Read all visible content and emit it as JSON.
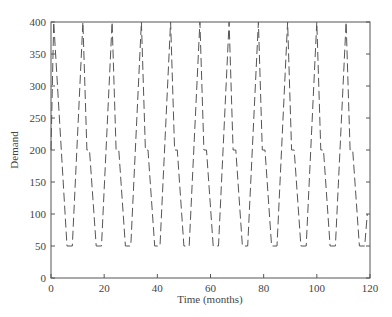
{
  "chart_data": {
    "type": "line",
    "title": "",
    "xlabel": "Time (months)",
    "ylabel": "Demand",
    "xlim": [
      0,
      120
    ],
    "ylim": [
      0,
      400
    ],
    "xticks": [
      0,
      20,
      40,
      60,
      80,
      100,
      120
    ],
    "yticks": [
      0,
      50,
      100,
      150,
      200,
      250,
      300,
      350,
      400
    ],
    "grid": false,
    "legend": null,
    "series": [
      {
        "name": "Demand",
        "style": "dashed",
        "color": "#555555",
        "x": [
          0,
          1,
          6,
          8,
          12,
          13.5,
          14.5,
          17,
          19,
          23,
          24.5,
          25.5,
          28,
          30,
          34,
          35.5,
          36.5,
          39,
          41,
          45,
          46.5,
          47.5,
          50,
          52,
          56,
          57.5,
          58.5,
          61,
          63,
          67,
          68.5,
          69.5,
          72,
          74,
          78,
          79.5,
          80.5,
          83,
          85,
          89,
          90.5,
          91.5,
          94,
          96,
          100,
          101.5,
          102.5,
          105,
          107,
          111,
          112.5,
          113.5,
          116,
          118,
          119
        ],
        "y": [
          200,
          400,
          50,
          50,
          400,
          200,
          200,
          50,
          50,
          400,
          200,
          200,
          50,
          50,
          400,
          200,
          200,
          50,
          50,
          400,
          200,
          200,
          50,
          50,
          400,
          200,
          200,
          50,
          50,
          400,
          200,
          200,
          50,
          50,
          400,
          200,
          200,
          50,
          50,
          400,
          200,
          200,
          50,
          50,
          400,
          200,
          200,
          50,
          50,
          400,
          200,
          200,
          50,
          50,
          100
        ]
      }
    ]
  },
  "axes": {
    "x_label": "Time (months)",
    "y_label": "Demand",
    "x_tick_labels": [
      "0",
      "20",
      "40",
      "60",
      "80",
      "100",
      "120"
    ],
    "y_tick_labels": [
      "0",
      "50",
      "100",
      "150",
      "200",
      "250",
      "300",
      "350",
      "400"
    ]
  }
}
